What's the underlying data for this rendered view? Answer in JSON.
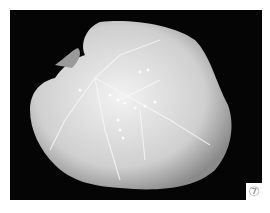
{
  "figure": {
    "panel_label": "⑦",
    "colors": {
      "background": "#050505",
      "leaf": "#d8d8d8",
      "frame": "#ffffff"
    }
  }
}
